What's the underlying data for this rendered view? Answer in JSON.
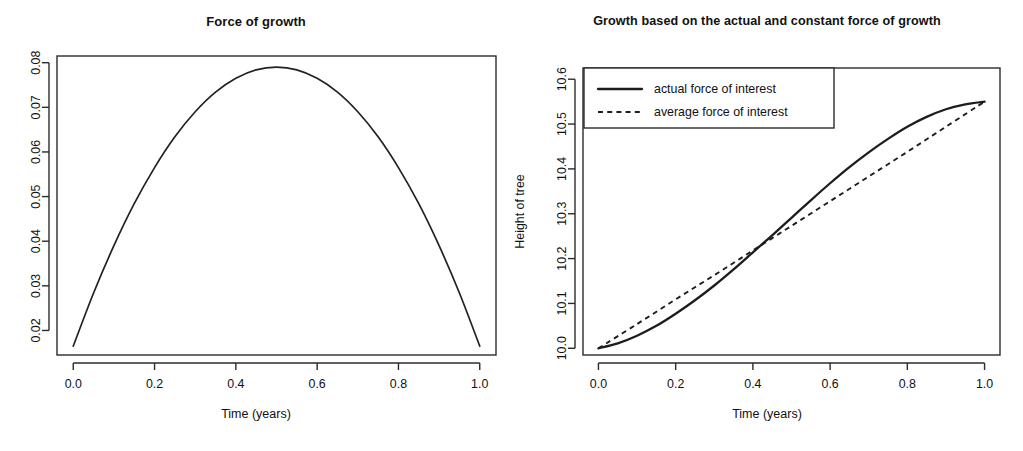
{
  "figure": {
    "background": "#ffffff",
    "ink_color": "#1d1d1d",
    "panels": 2
  },
  "panel_left": {
    "title": "Force of growth",
    "xlabel": "Time (years)",
    "ylabel": ""
  },
  "panel_right": {
    "title": "Growth based on the actual and constant force of growth",
    "xlabel": "Time (years)",
    "ylabel": "Height of tree",
    "legend": {
      "position": "top-left",
      "entries": [
        {
          "label": "actual force of interest",
          "style": "solid"
        },
        {
          "label": "average force of interest",
          "style": "dashed"
        }
      ]
    }
  },
  "chart_data": [
    {
      "type": "line",
      "id": "force-of-growth",
      "title": "Force of growth",
      "xlabel": "Time (years)",
      "ylabel": "",
      "xlim": [
        -0.04,
        1.04
      ],
      "ylim": [
        0.0145,
        0.0815
      ],
      "xticks": [
        "0.0",
        "0.2",
        "0.4",
        "0.6",
        "0.8",
        "1.0"
      ],
      "xtick_values": [
        0.0,
        0.2,
        0.4,
        0.6,
        0.8,
        1.0
      ],
      "yticks": [
        "0.02",
        "0.03",
        "0.04",
        "0.05",
        "0.06",
        "0.07",
        "0.08"
      ],
      "ytick_values": [
        0.02,
        0.03,
        0.04,
        0.05,
        0.06,
        0.07,
        0.08
      ],
      "grid": false,
      "legend": null,
      "series": [
        {
          "name": "force of growth",
          "style": "solid",
          "x": [
            0.0,
            0.05,
            0.1,
            0.15,
            0.2,
            0.25,
            0.3,
            0.35,
            0.4,
            0.45,
            0.5,
            0.55,
            0.6,
            0.65,
            0.7,
            0.75,
            0.8,
            0.85,
            0.9,
            0.95,
            1.0
          ],
          "y": [
            0.0165,
            0.0284,
            0.039,
            0.0484,
            0.0565,
            0.0634,
            0.069,
            0.0734,
            0.0765,
            0.0784,
            0.079,
            0.0784,
            0.0765,
            0.0734,
            0.069,
            0.0634,
            0.0565,
            0.0484,
            0.039,
            0.0284,
            0.0165
          ]
        }
      ]
    },
    {
      "type": "line",
      "id": "tree-growth",
      "title": "Growth based on the actual and constant force of growth",
      "xlabel": "Time (years)",
      "ylabel": "Height of tree",
      "xlim": [
        -0.04,
        1.04
      ],
      "ylim": [
        9.985,
        10.625
      ],
      "xticks": [
        "0.0",
        "0.2",
        "0.4",
        "0.6",
        "0.8",
        "1.0"
      ],
      "xtick_values": [
        0.0,
        0.2,
        0.4,
        0.6,
        0.8,
        1.0
      ],
      "yticks": [
        "10.0",
        "10.1",
        "10.2",
        "10.3",
        "10.4",
        "10.5",
        "10.6"
      ],
      "ytick_values": [
        10.0,
        10.1,
        10.2,
        10.3,
        10.4,
        10.5,
        10.6
      ],
      "grid": false,
      "legend_position": "top-left",
      "series": [
        {
          "name": "actual force of interest",
          "style": "solid",
          "x": [
            0.0,
            0.05,
            0.1,
            0.15,
            0.2,
            0.25,
            0.3,
            0.35,
            0.4,
            0.45,
            0.5,
            0.55,
            0.6,
            0.65,
            0.7,
            0.75,
            0.8,
            0.85,
            0.9,
            0.95,
            1.0
          ],
          "y": [
            10.0,
            10.011,
            10.028,
            10.05,
            10.077,
            10.107,
            10.14,
            10.176,
            10.214,
            10.252,
            10.291,
            10.33,
            10.368,
            10.404,
            10.437,
            10.467,
            10.494,
            10.516,
            10.533,
            10.544,
            10.55
          ]
        },
        {
          "name": "average force of interest",
          "style": "dashed",
          "x": [
            0.0,
            0.1,
            0.2,
            0.3,
            0.4,
            0.5,
            0.6,
            0.7,
            0.8,
            0.9,
            1.0
          ],
          "y": [
            10.0,
            10.054,
            10.109,
            10.163,
            10.218,
            10.273,
            10.328,
            10.383,
            10.438,
            10.494,
            10.55
          ]
        }
      ]
    }
  ]
}
